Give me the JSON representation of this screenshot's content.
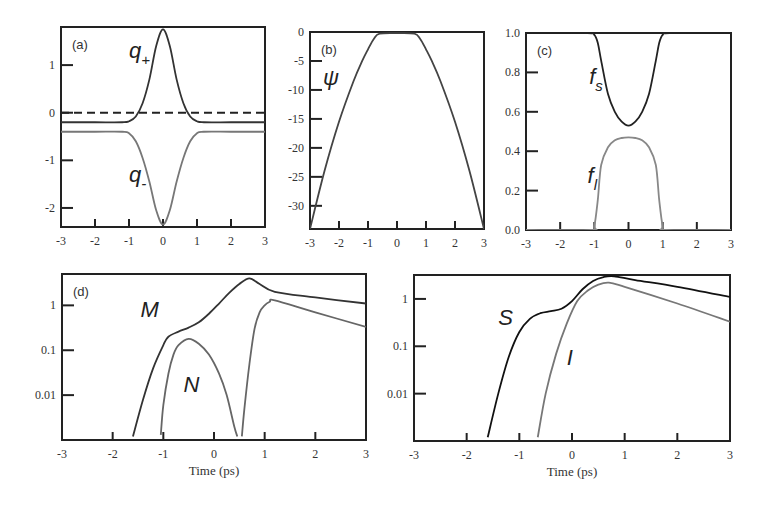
{
  "chart_data": [
    {
      "id": "a",
      "type": "line",
      "panel_label": "(a)",
      "xlim": [
        -3,
        3
      ],
      "ylim": [
        -2.4,
        1.8
      ],
      "yscale": "linear",
      "xticks": [
        -3,
        -2,
        -1,
        0,
        1,
        2,
        3
      ],
      "xtick_labels": [
        "-3",
        "-2",
        "-1",
        "0",
        "1",
        "2",
        "3"
      ],
      "yticks": [
        1,
        0,
        -1,
        -2
      ],
      "ytick_labels": [
        "1",
        "0",
        "-1",
        "-2"
      ],
      "xlabel": "",
      "ylabel": "",
      "reference_line": {
        "y": 0,
        "style": "dashed"
      },
      "series": [
        {
          "name": "q+",
          "label_main": "q",
          "label_sub": "+",
          "color": "#333333",
          "x": [
            -3,
            -2,
            -1.2,
            -1,
            -0.8,
            -0.6,
            -0.4,
            -0.2,
            0,
            0.2,
            0.4,
            0.6,
            0.8,
            1,
            1.2,
            2,
            3
          ],
          "y": [
            -0.2,
            -0.2,
            -0.2,
            -0.18,
            -0.08,
            0.2,
            0.7,
            1.4,
            1.75,
            1.4,
            0.7,
            0.2,
            -0.08,
            -0.18,
            -0.2,
            -0.2,
            -0.2
          ]
        },
        {
          "name": "q-",
          "label_main": "q",
          "label_sub": "-",
          "color": "#777777",
          "x": [
            -3,
            -2,
            -1.2,
            -1,
            -0.8,
            -0.6,
            -0.4,
            -0.2,
            0,
            0.2,
            0.4,
            0.6,
            0.8,
            1,
            1.2,
            2,
            3
          ],
          "y": [
            -0.4,
            -0.4,
            -0.4,
            -0.43,
            -0.6,
            -0.95,
            -1.45,
            -2.05,
            -2.35,
            -2.05,
            -1.45,
            -0.95,
            -0.6,
            -0.43,
            -0.4,
            -0.4,
            -0.4
          ]
        }
      ]
    },
    {
      "id": "b",
      "type": "line",
      "panel_label": "(b)",
      "xlim": [
        -3,
        3
      ],
      "ylim": [
        -34,
        0
      ],
      "yscale": "linear",
      "xticks": [
        -3,
        -2,
        -1,
        0,
        1,
        2,
        3
      ],
      "xtick_labels": [
        "-3",
        "-2",
        "-1",
        "0",
        "1",
        "2",
        "3"
      ],
      "yticks": [
        0,
        -5,
        -10,
        -15,
        -20,
        -25,
        -30
      ],
      "ytick_labels": [
        "0",
        "-5",
        "-10",
        "-15",
        "-20",
        "-25",
        "-30"
      ],
      "xlabel": "",
      "ylabel": "",
      "series": [
        {
          "name": "psi",
          "label_main": "ψ",
          "label_sub": "",
          "color": "#444444",
          "x": [
            -3,
            -2.5,
            -2,
            -1.5,
            -1.2,
            -1,
            -0.8,
            -0.6,
            0,
            0.6,
            0.8,
            1,
            1.2,
            1.5,
            2,
            2.5,
            3
          ],
          "y": [
            -34,
            -24,
            -15.5,
            -8.5,
            -5,
            -3,
            -1.2,
            -0.3,
            -0.2,
            -0.3,
            -1.2,
            -3,
            -5,
            -8.5,
            -15.5,
            -24,
            -34
          ]
        }
      ]
    },
    {
      "id": "c",
      "type": "line",
      "panel_label": "(c)",
      "xlim": [
        -3,
        3
      ],
      "ylim": [
        0,
        1
      ],
      "yscale": "linear",
      "xticks": [
        -3,
        -2,
        -1,
        0,
        1,
        2,
        3
      ],
      "xtick_labels": [
        "-3",
        "-2",
        "-1",
        "0",
        "1",
        "2",
        "3"
      ],
      "yticks": [
        1.0,
        0.8,
        0.6,
        0.4,
        0.2,
        0.0
      ],
      "ytick_labels": [
        "1.0",
        "0.8",
        "0.6",
        "0.4",
        "0.2",
        "0.0"
      ],
      "xlabel": "",
      "ylabel": "",
      "series": [
        {
          "name": "fs",
          "label_main": "f",
          "label_sub": "s",
          "color": "#222222",
          "x": [
            -3,
            -1.2,
            -1.0,
            -0.9,
            -0.8,
            -0.6,
            -0.4,
            -0.2,
            0,
            0.2,
            0.4,
            0.6,
            0.8,
            0.9,
            1.0,
            1.2,
            3
          ],
          "y": [
            1.0,
            1.0,
            0.99,
            0.95,
            0.86,
            0.69,
            0.6,
            0.55,
            0.53,
            0.55,
            0.6,
            0.69,
            0.86,
            0.95,
            0.99,
            1.0,
            1.0
          ]
        },
        {
          "name": "fl",
          "label_main": "f",
          "label_sub": "l",
          "color": "#888888",
          "x": [
            -3,
            -1.1,
            -1.0,
            -0.9,
            -0.8,
            -0.6,
            -0.4,
            -0.2,
            0,
            0.2,
            0.4,
            0.6,
            0.8,
            0.9,
            1.0,
            1.1,
            3
          ],
          "y": [
            0.0,
            0.0,
            0.02,
            0.15,
            0.33,
            0.42,
            0.455,
            0.467,
            0.47,
            0.467,
            0.455,
            0.42,
            0.33,
            0.15,
            0.02,
            0.0,
            0.0
          ]
        }
      ]
    },
    {
      "id": "d",
      "type": "line",
      "panel_label": "(d)",
      "xlim": [
        -3,
        3
      ],
      "ylim": [
        0.001,
        5
      ],
      "yscale": "log",
      "xticks": [
        -3,
        -2,
        -1,
        0,
        1,
        2,
        3
      ],
      "xtick_labels": [
        "-3",
        "-2",
        "-1",
        "0",
        "1",
        "2",
        "3"
      ],
      "yticks": [
        1,
        0.1,
        0.01
      ],
      "ytick_labels": [
        "1",
        "0.1",
        "0.01"
      ],
      "xlabel": "Time (ps)",
      "ylabel": "",
      "series": [
        {
          "name": "M",
          "label_main": "M",
          "label_sub": "",
          "color": "#333333",
          "x": [
            -1.6,
            -1.4,
            -1.2,
            -1.0,
            -0.9,
            -0.7,
            -0.5,
            -0.3,
            -0.1,
            0.1,
            0.3,
            0.5,
            0.7,
            0.9,
            1.2,
            2,
            3
          ],
          "y": [
            0.0012,
            0.008,
            0.04,
            0.13,
            0.2,
            0.26,
            0.32,
            0.42,
            0.65,
            1.1,
            1.9,
            3.0,
            4.0,
            3.0,
            2.0,
            1.5,
            1.1
          ]
        },
        {
          "name": "N",
          "label_main": "N",
          "label_sub": "",
          "color": "#666666",
          "x": [
            -1.05,
            -1.0,
            -0.9,
            -0.8,
            -0.7,
            -0.5,
            -0.3,
            -0.1,
            0.1,
            0.25,
            0.4,
            0.46
          ],
          "y": [
            0.0013,
            0.006,
            0.03,
            0.08,
            0.13,
            0.18,
            0.14,
            0.08,
            0.03,
            0.01,
            0.002,
            0.0012
          ]
        },
        {
          "name": "N2",
          "label_main": "",
          "label_sub": "",
          "color": "#666666",
          "x": [
            0.55,
            0.6,
            0.7,
            0.8,
            0.9,
            1.0,
            1.1,
            1.2,
            2,
            3
          ],
          "y": [
            0.0012,
            0.005,
            0.05,
            0.3,
            0.7,
            1.0,
            1.2,
            1.3,
            0.7,
            0.33
          ]
        }
      ]
    },
    {
      "id": "e",
      "type": "line",
      "panel_label": "",
      "xlim": [
        -3,
        3
      ],
      "ylim": [
        0.001,
        3.2
      ],
      "yscale": "log",
      "xticks": [
        -3,
        -2,
        -1,
        0,
        1,
        2,
        3
      ],
      "xtick_labels": [
        "-3",
        "-2",
        "-1",
        "0",
        "1",
        "2",
        "3"
      ],
      "yticks": [
        1,
        0.1,
        0.01
      ],
      "ytick_labels": [
        "1",
        "0.1",
        "0.01"
      ],
      "xlabel": "Time (ps)",
      "ylabel": "",
      "series": [
        {
          "name": "S",
          "label_main": "S",
          "label_sub": "",
          "color": "#111111",
          "x": [
            -1.6,
            -1.4,
            -1.2,
            -1.0,
            -0.8,
            -0.6,
            -0.4,
            -0.2,
            0,
            0.2,
            0.4,
            0.6,
            0.8,
            1.2,
            2,
            3
          ],
          "y": [
            0.0012,
            0.01,
            0.06,
            0.2,
            0.38,
            0.5,
            0.55,
            0.62,
            0.9,
            1.6,
            2.4,
            2.9,
            3.0,
            2.5,
            1.8,
            1.1
          ]
        },
        {
          "name": "I",
          "label_main": "I",
          "label_sub": "",
          "color": "#777777",
          "x": [
            -0.65,
            -0.5,
            -0.3,
            -0.1,
            0.1,
            0.3,
            0.5,
            0.7,
            1.0,
            2,
            3
          ],
          "y": [
            0.0012,
            0.01,
            0.07,
            0.3,
            0.9,
            1.5,
            2.0,
            2.2,
            1.8,
            0.8,
            0.33
          ]
        }
      ]
    }
  ]
}
